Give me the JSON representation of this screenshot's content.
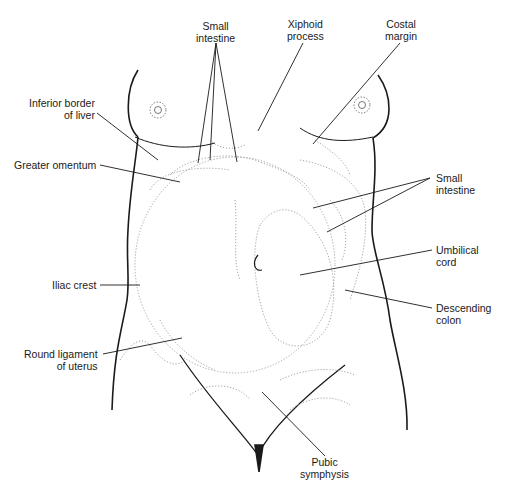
{
  "figure": {
    "line_color": "#1a1a1a",
    "dotted_color": "#9a9a9a"
  },
  "labels": {
    "small_intestine_top": {
      "line1": "Small",
      "line2": "intestine"
    },
    "xiphoid_process": {
      "line1": "Xiphoid",
      "line2": "process"
    },
    "costal_margin": {
      "line1": "Costal",
      "line2": "margin"
    },
    "inferior_border_liver": {
      "line1": "Inferior border",
      "line2": "of liver"
    },
    "greater_omentum": {
      "line1": "Greater omentum"
    },
    "small_intestine_right": {
      "line1": "Small",
      "line2": "intestine"
    },
    "umbilical_cord": {
      "line1": "Umbilical",
      "line2": "cord"
    },
    "iliac_crest": {
      "line1": "Iliac crest"
    },
    "descending_colon": {
      "line1": "Descending",
      "line2": "colon"
    },
    "round_ligament": {
      "line1": "Round ligament",
      "line2": "of uterus"
    },
    "pubic_symphysis": {
      "line1": "Pubic",
      "line2": "symphysis"
    }
  }
}
